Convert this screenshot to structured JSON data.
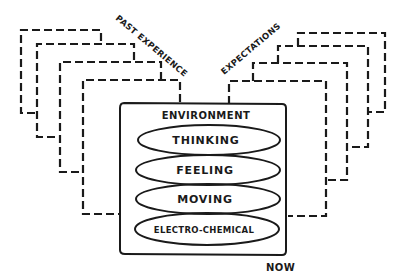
{
  "diagram": {
    "labels": {
      "past": "PAST EXPERIENCE",
      "expectations": "EXPECTATIONS",
      "environment": "ENVIRONMENT",
      "now": "NOW"
    },
    "layers": [
      {
        "label": "THINKING"
      },
      {
        "label": "FEELING"
      },
      {
        "label": "MOVING"
      },
      {
        "label": "ELECTRO-CHEMICAL"
      }
    ],
    "past_frames_count": 4,
    "expectation_frames_count": 4,
    "colors": {
      "ink": "#1a1a1a",
      "background": "#ffffff"
    }
  }
}
